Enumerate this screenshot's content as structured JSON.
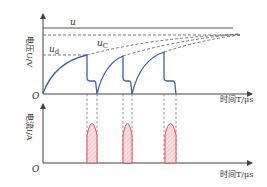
{
  "top_panel": {
    "y_axis_label": "电压U/V",
    "x_axis_label": "时间T/μs",
    "origin_label": "O",
    "curve_labels": {
      "u": "u",
      "ud": "u",
      "ud_sub": "d",
      "uc": "u",
      "uc_sub": "C"
    },
    "colors": {
      "waveform": "#3b63a8",
      "axis": "#444444",
      "dashed": "#555555"
    }
  },
  "bottom_panel": {
    "y_axis_label": "电流I/A",
    "x_axis_label": "时间T/μs",
    "origin_label": "O",
    "pulse_count": 3,
    "colors": {
      "pulse_stroke": "#d9534f",
      "pulse_fill": "#f7c9cf"
    }
  }
}
